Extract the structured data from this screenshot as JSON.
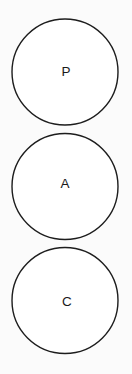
{
  "diagram": {
    "type": "vertical-circle-stack",
    "background_color": "#fbfbfb",
    "circle_fill_color": "#ffffff",
    "circle_stroke_color": "#1d1d1d",
    "label_color": "#1a1a1a",
    "nodes": [
      {
        "id": "node-p",
        "label": "P",
        "cx": 65,
        "cy": 72,
        "r": 53,
        "label_x": 66,
        "label_y": 72.5
      },
      {
        "id": "node-a",
        "label": "A",
        "cx": 65,
        "cy": 186.5,
        "r": 53,
        "label_x": 65,
        "label_y": 184.5
      },
      {
        "id": "node-c",
        "label": "C",
        "cx": 65,
        "cy": 300.5,
        "r": 53,
        "label_x": 67,
        "label_y": 302
      }
    ]
  }
}
